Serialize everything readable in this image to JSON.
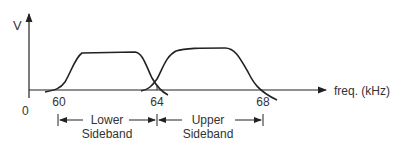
{
  "diagram": {
    "y_axis_label": "V",
    "x_axis_label": "freq. (kHz)",
    "origin_label": "0",
    "ticks": [
      {
        "value": "60"
      },
      {
        "value": "64"
      },
      {
        "value": "68"
      }
    ],
    "bands": [
      {
        "name": "lower",
        "line1": "Lower",
        "line2": "Sideband",
        "from": 60,
        "to": 64
      },
      {
        "name": "upper",
        "line1": "Upper",
        "line2": "Sideband",
        "from": 64,
        "to": 68
      }
    ],
    "colors": {
      "line": "#222222",
      "text": "#333333"
    }
  }
}
